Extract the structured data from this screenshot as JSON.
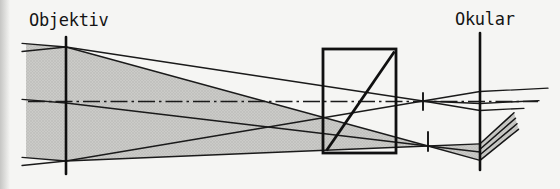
{
  "figure": {
    "labels": {
      "objective": "Objektiv",
      "eyepiece": "Okular"
    },
    "colors": {
      "ink": "#141414",
      "paper": "#f5f5f3",
      "beam_fill_base": "#cbcbc8",
      "beam_fill_dot": "#b4b4b1"
    }
  }
}
